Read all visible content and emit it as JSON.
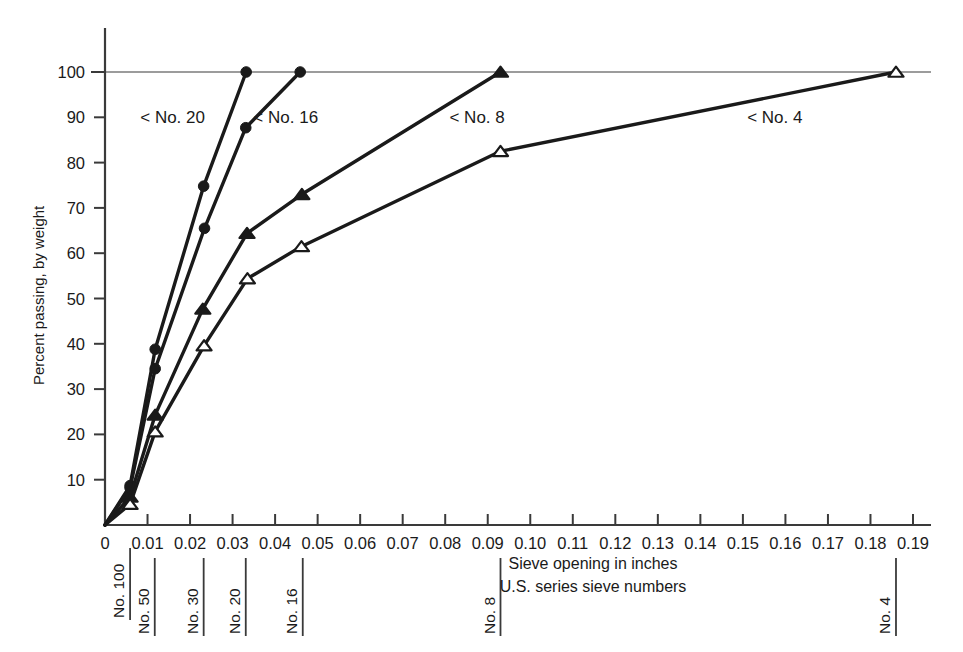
{
  "chart_data": {
    "type": "line",
    "title": "",
    "xlabel": "Sieve opening in inches",
    "ylabel": "Percent passing, by weight",
    "xlim": [
      0,
      0.19
    ],
    "ylim": [
      0,
      100
    ],
    "grid": false,
    "legend_position": "inline-annotations",
    "x_tick_labels": [
      "0",
      "0.01",
      "0.02",
      "0.03",
      "0.04",
      "0.05",
      "0.06",
      "0.07",
      "0.08",
      "0.09",
      "0.10",
      "0.11",
      "0.12",
      "0.13",
      "0.14",
      "0.15",
      "0.16",
      "0.17",
      "0.18",
      "0.19"
    ],
    "x_tick_values": [
      0,
      0.01,
      0.02,
      0.03,
      0.04,
      0.05,
      0.06,
      0.07,
      0.08,
      0.09,
      0.1,
      0.11,
      0.12,
      0.13,
      0.14,
      0.15,
      0.16,
      0.17,
      0.18,
      0.19
    ],
    "y_tick_labels": [
      "10",
      "20",
      "30",
      "40",
      "50",
      "60",
      "70",
      "80",
      "90",
      "100"
    ],
    "y_tick_values": [
      10,
      20,
      30,
      40,
      50,
      60,
      70,
      80,
      90,
      100
    ],
    "reference_line_y": 100,
    "series": [
      {
        "name": "< No. 20",
        "marker": "filled-circle",
        "label_x": 0.0159,
        "label_y": 90,
        "points": [
          {
            "x": 0.0,
            "y": 0
          },
          {
            "x": 0.0059,
            "y": 8.7
          },
          {
            "x": 0.0118,
            "y": 38.8
          },
          {
            "x": 0.0232,
            "y": 74.8
          },
          {
            "x": 0.0332,
            "y": 100
          }
        ]
      },
      {
        "name": "< No. 16",
        "marker": "filled-circle",
        "label_x": 0.0425,
        "label_y": 90,
        "points": [
          {
            "x": 0.0,
            "y": 0
          },
          {
            "x": 0.0059,
            "y": 8.2
          },
          {
            "x": 0.0118,
            "y": 34.5
          },
          {
            "x": 0.0234,
            "y": 65.5
          },
          {
            "x": 0.0331,
            "y": 87.7
          },
          {
            "x": 0.0459,
            "y": 100
          }
        ]
      },
      {
        "name": "< No. 8",
        "marker": "filled-triangle",
        "label_x": 0.0875,
        "label_y": 90,
        "points": [
          {
            "x": 0.0,
            "y": 0
          },
          {
            "x": 0.0059,
            "y": 6.2
          },
          {
            "x": 0.0118,
            "y": 24.3
          },
          {
            "x": 0.023,
            "y": 47.7
          },
          {
            "x": 0.0334,
            "y": 64.4
          },
          {
            "x": 0.0463,
            "y": 73.0
          },
          {
            "x": 0.093,
            "y": 100
          }
        ]
      },
      {
        "name": "< No. 4",
        "marker": "open-triangle",
        "label_x": 0.1575,
        "label_y": 90,
        "points": [
          {
            "x": 0.0,
            "y": 0
          },
          {
            "x": 0.0059,
            "y": 4.6
          },
          {
            "x": 0.0118,
            "y": 20.6
          },
          {
            "x": 0.0233,
            "y": 39.6
          },
          {
            "x": 0.0335,
            "y": 54.4
          },
          {
            "x": 0.0462,
            "y": 61.5
          },
          {
            "x": 0.093,
            "y": 82.5
          },
          {
            "x": 0.186,
            "y": 100
          }
        ]
      }
    ],
    "sieve_markers": [
      {
        "label": "No. 100",
        "x": 0.0059,
        "tall": true
      },
      {
        "label": "No. 50",
        "x": 0.0117,
        "tall": false
      },
      {
        "label": "No. 30",
        "x": 0.0232,
        "tall": false
      },
      {
        "label": "No. 20",
        "x": 0.0331,
        "tall": false
      },
      {
        "label": "No. 16",
        "x": 0.0465,
        "tall": false
      },
      {
        "label": "No. 8",
        "x": 0.093,
        "tall": false
      },
      {
        "label": "No. 4",
        "x": 0.186,
        "tall": false
      }
    ],
    "caption_lines": [
      "Sieve opening in inches",
      "U.S. series sieve numbers"
    ],
    "colors": {
      "ink": "#1a1a1a",
      "axis": "#3a3a3a",
      "background": "#ffffff"
    }
  }
}
